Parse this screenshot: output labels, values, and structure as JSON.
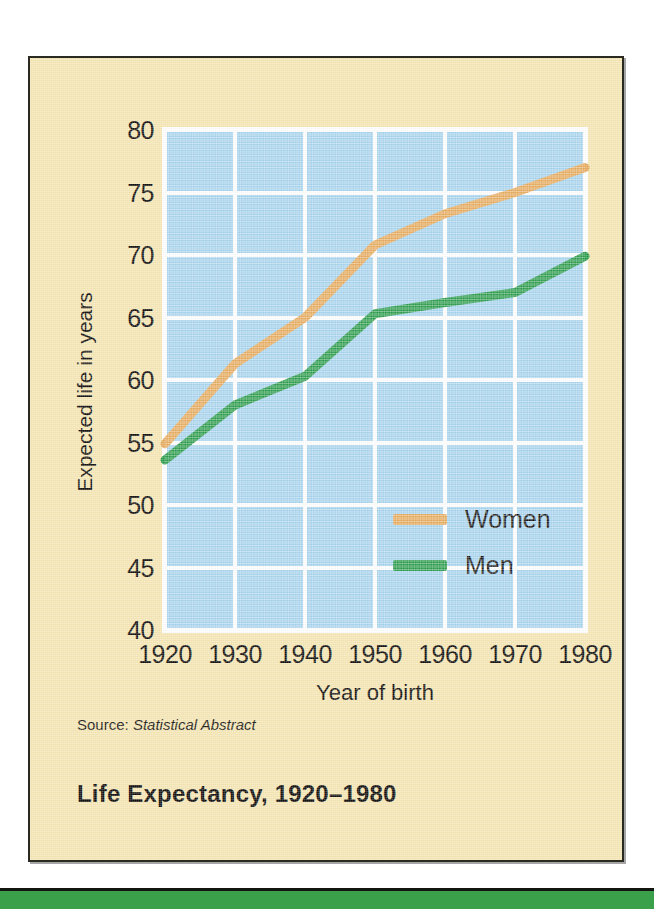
{
  "figure": {
    "title": "Life Expectancy, 1920–1980",
    "source_prefix": "Source:",
    "source_work": "Statistical Abstract"
  },
  "colors": {
    "card_background": "#F7E8B6",
    "card_border": "#2B2A22",
    "plot_background": "#A8D5EF",
    "gridline": "#FFFFFF",
    "women_line": "#E8AC5E",
    "men_line": "#2E9E4E",
    "text": "#151311",
    "bottom_band": "#3AA14A"
  },
  "chart_data": {
    "type": "line",
    "title": "Life Expectancy, 1920–1980",
    "xlabel": "Year of birth",
    "ylabel": "Expected life in years",
    "x": [
      1920,
      1930,
      1940,
      1950,
      1960,
      1970,
      1980
    ],
    "xlim": [
      1920,
      1980
    ],
    "ylim": [
      40,
      80
    ],
    "xticks": [
      "1920",
      "1930",
      "1940",
      "1950",
      "1960",
      "1970",
      "1980"
    ],
    "yticks": [
      "40",
      "45",
      "50",
      "55",
      "60",
      "65",
      "70",
      "75",
      "80"
    ],
    "grid": true,
    "legend_position": "inside-center",
    "series": [
      {
        "name": "Women",
        "color": "#E8AC5E",
        "values": [
          54.9,
          61.3,
          65.0,
          70.8,
          73.3,
          75.0,
          77.0
        ]
      },
      {
        "name": "Men",
        "color": "#2E9E4E",
        "values": [
          53.6,
          58.0,
          60.3,
          65.3,
          66.2,
          67.0,
          69.9
        ]
      }
    ]
  }
}
